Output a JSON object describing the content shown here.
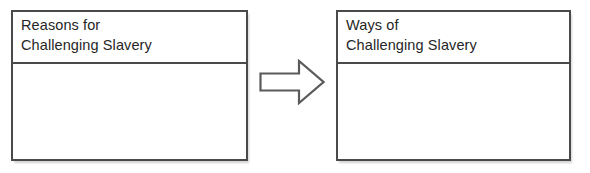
{
  "page": {
    "background_color": "#ffffff",
    "border_color": "#4a4a4a",
    "text_color": "#262626"
  },
  "diagram": {
    "type": "two-column-comparison-organizer",
    "left_table": {
      "header": "Reasons for\nChallenging Slavery",
      "header_line_1": "Reasons for",
      "header_line_2": "Challenging Slavery",
      "body": ""
    },
    "connector": {
      "icon": "right-block-arrow",
      "direction": "right",
      "label": ""
    },
    "right_table": {
      "header": "Ways of\nChallenging Slavery",
      "header_line_1": "Ways of",
      "header_line_2": "Challenging Slavery",
      "body": ""
    }
  }
}
